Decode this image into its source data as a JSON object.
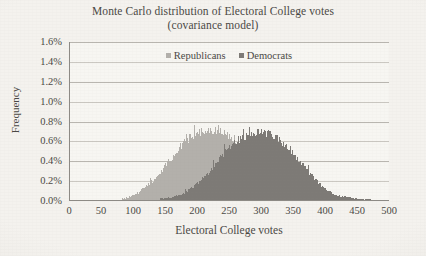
{
  "chart_data": {
    "type": "bar",
    "title": "Monte Carlo distribution of Electoral College votes",
    "subtitle": "(covariance model)",
    "xlabel": "Electoral College votes",
    "ylabel": "Frequency",
    "xlim": [
      0,
      500
    ],
    "ylim": [
      0.0,
      1.6
    ],
    "xticks": [
      0,
      50,
      100,
      150,
      200,
      250,
      300,
      350,
      400,
      450,
      500
    ],
    "xtick_labels": [
      "0",
      "50",
      "100",
      "150",
      "200",
      "250",
      "300",
      "350",
      "400",
      "450",
      "500"
    ],
    "yticks": [
      0.0,
      0.2,
      0.4,
      0.6,
      0.8,
      1.0,
      1.2,
      1.4,
      1.6
    ],
    "ytick_labels": [
      "0.0%",
      "0.2%",
      "0.4%",
      "0.6%",
      "0.8%",
      "1.0%",
      "1.2%",
      "1.4%",
      "1.6%"
    ],
    "grid": "horizontal",
    "legend_position": "top-center",
    "bin_width": 2,
    "series": [
      {
        "name": "Republicans",
        "color": "#b3b0ab",
        "peak_x": 232,
        "peak_value": 0.69,
        "mean": 232,
        "stdev": 58,
        "x_start": 80,
        "x_end": 400,
        "x": [
          80,
          90,
          100,
          110,
          120,
          130,
          140,
          150,
          160,
          170,
          180,
          190,
          200,
          210,
          220,
          230,
          240,
          250,
          260,
          270,
          280,
          290,
          300,
          310,
          320,
          330,
          340,
          350,
          360,
          370,
          380,
          390,
          400
        ],
        "values": [
          0.01,
          0.02,
          0.05,
          0.09,
          0.14,
          0.2,
          0.27,
          0.35,
          0.43,
          0.51,
          0.58,
          0.63,
          0.67,
          0.69,
          0.69,
          0.69,
          0.67,
          0.63,
          0.58,
          0.51,
          0.44,
          0.36,
          0.29,
          0.22,
          0.16,
          0.11,
          0.07,
          0.05,
          0.03,
          0.02,
          0.01,
          0.01,
          0.0
        ]
      },
      {
        "name": "Democrats",
        "color": "#7d7a76",
        "peak_x": 308,
        "peak_value": 0.67,
        "mean": 306,
        "stdev": 58,
        "x_start": 140,
        "x_end": 470,
        "x": [
          140,
          150,
          160,
          170,
          180,
          190,
          200,
          210,
          220,
          230,
          240,
          250,
          260,
          270,
          280,
          290,
          300,
          310,
          320,
          330,
          340,
          350,
          360,
          370,
          380,
          390,
          400,
          410,
          420,
          430,
          440,
          450,
          460,
          470
        ],
        "values": [
          0.01,
          0.02,
          0.03,
          0.05,
          0.08,
          0.12,
          0.17,
          0.23,
          0.3,
          0.38,
          0.46,
          0.53,
          0.59,
          0.63,
          0.66,
          0.67,
          0.67,
          0.66,
          0.63,
          0.58,
          0.52,
          0.45,
          0.37,
          0.29,
          0.22,
          0.16,
          0.11,
          0.07,
          0.04,
          0.03,
          0.02,
          0.01,
          0.01,
          0.0
        ]
      }
    ]
  },
  "legend": {
    "items": [
      {
        "label": "Republicans",
        "color": "#b3b0ab"
      },
      {
        "label": "Democrats",
        "color": "#7d7a76"
      }
    ]
  }
}
